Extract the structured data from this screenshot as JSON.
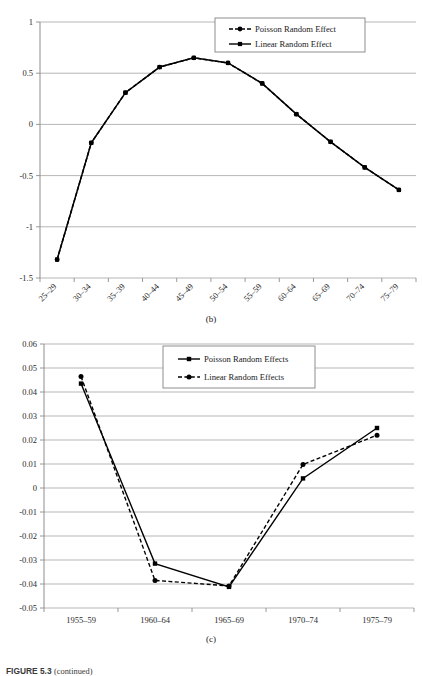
{
  "figure": {
    "caption_label": "FIGURE 5.3",
    "caption_note": "(continued)"
  },
  "panel_b": {
    "caption": "(b)",
    "legend": [
      {
        "label": "Poisson Random Effect",
        "marker": "circle",
        "dash": "dashed",
        "color": "#000000"
      },
      {
        "label": "Linear Random Effect",
        "marker": "square",
        "dash": "solid",
        "color": "#000000"
      }
    ]
  },
  "panel_c": {
    "caption": "(c)",
    "legend": [
      {
        "label": "Poisson Random Effects",
        "marker": "square",
        "dash": "solid",
        "color": "#000000"
      },
      {
        "label": "Linear Random Effects",
        "marker": "circle",
        "dash": "dashed",
        "color": "#000000"
      }
    ]
  },
  "chart_data": [
    {
      "id": "panel-b",
      "type": "line",
      "title": "",
      "subtitle": "(b)",
      "xlabel": "",
      "ylabel": "",
      "categories": [
        "25–29",
        "30–34",
        "35–39",
        "40–44",
        "45–49",
        "50–54",
        "55–59",
        "60–64",
        "65–69",
        "70–74",
        "75–79"
      ],
      "ylim": [
        -1.5,
        1
      ],
      "yticks": [
        1,
        0.5,
        0,
        -0.5,
        -1,
        -1.5
      ],
      "ytick_labels": [
        "1",
        "0.5",
        "0",
        "-0.5",
        "-1",
        "-1.5"
      ],
      "grid": true,
      "legend_position": "top-right",
      "series": [
        {
          "name": "Poisson Random Effect",
          "marker": "circle",
          "dash": "dashed",
          "color": "#000000",
          "values": [
            -1.32,
            -0.18,
            0.31,
            0.56,
            0.65,
            0.6,
            0.4,
            0.1,
            -0.17,
            -0.42,
            -0.64
          ]
        },
        {
          "name": "Linear Random Effect",
          "marker": "square",
          "dash": "solid",
          "color": "#000000",
          "values": [
            -1.32,
            -0.18,
            0.31,
            0.56,
            0.65,
            0.6,
            0.4,
            0.1,
            -0.17,
            -0.42,
            -0.64
          ]
        }
      ]
    },
    {
      "id": "panel-c",
      "type": "line",
      "title": "",
      "subtitle": "(c)",
      "xlabel": "",
      "ylabel": "",
      "categories": [
        "1955–59",
        "1960–64",
        "1965–69",
        "1970–74",
        "1975–79"
      ],
      "ylim": [
        -0.05,
        0.06
      ],
      "yticks": [
        0.06,
        0.05,
        0.04,
        0.03,
        0.02,
        0.01,
        0,
        -0.01,
        -0.02,
        -0.03,
        -0.04,
        -0.05
      ],
      "ytick_labels": [
        "0.06",
        "0.05",
        "0.04",
        "0.03",
        "0.02",
        "0.01",
        "0",
        "-0.01",
        "-0.02",
        "-0.03",
        "-0.04",
        "-0.05"
      ],
      "grid": true,
      "legend_position": "top-center",
      "series": [
        {
          "name": "Poisson Random Effects",
          "marker": "square",
          "dash": "solid",
          "color": "#000000",
          "values": [
            0.0435,
            -0.0315,
            -0.0412,
            0.004,
            0.025
          ]
        },
        {
          "name": "Linear Random Effects",
          "marker": "circle",
          "dash": "dashed",
          "color": "#000000",
          "values": [
            0.0465,
            -0.0385,
            -0.0408,
            0.0098,
            0.022
          ]
        }
      ]
    }
  ]
}
